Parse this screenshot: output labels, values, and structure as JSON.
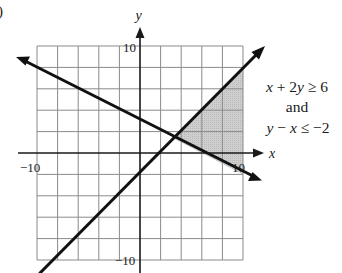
{
  "figure": {
    "partial_label": ")",
    "axes": {
      "x_label": "x",
      "y_label": "y",
      "x_range": [
        -10,
        10
      ],
      "y_range": [
        -10,
        10
      ],
      "grid_step": 2,
      "ticks": {
        "x_neg": "−10",
        "x_pos": "10",
        "y_pos": "10",
        "y_neg": "−10"
      }
    },
    "annotation": {
      "line1_a": "x",
      "line1_b": " + 2",
      "line1_c": "y",
      "line1_d": " ≥ 6",
      "line2": "and",
      "line3_a": "y",
      "line3_b": " − ",
      "line3_c": "x",
      "line3_d": " ≤ −2"
    },
    "inequalities": [
      {
        "expr": "x + 2y ≥ 6",
        "boundary": "y = 3 − x/2",
        "shade": "above"
      },
      {
        "expr": "y − x ≤ −2",
        "boundary": "y = x − 2",
        "shade": "below"
      }
    ],
    "intersection": {
      "x": 3.333,
      "y": 1.333
    },
    "shade_color": "#c8c8c8",
    "grid_color": "#8a8a8a"
  }
}
